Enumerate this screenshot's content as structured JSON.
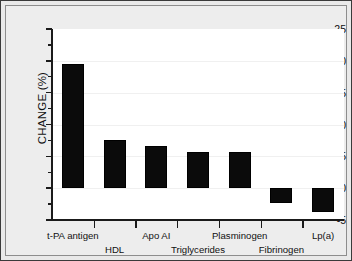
{
  "chart_data": {
    "type": "bar",
    "title": "",
    "subtitle": "",
    "xlabel": "",
    "ylabel": "CHANGE (%)",
    "categories": [
      "t-PA antigen",
      "HDL",
      "Apo AI",
      "Triglycerides",
      "Plasminogen",
      "Fibrinogen",
      "Lp(a)"
    ],
    "values": [
      19.5,
      7.5,
      6.7,
      5.7,
      5.7,
      -2.3,
      -3.8
    ],
    "series": [
      {
        "name": "Change",
        "values": [
          19.5,
          7.5,
          6.7,
          5.7,
          5.7,
          -2.3,
          -3.8
        ]
      }
    ],
    "ylim": [
      -5,
      25
    ],
    "ytick_labels": [
      "25",
      "20",
      "15",
      "10",
      "5",
      "0",
      "-5"
    ],
    "ytick_values": [
      25,
      20,
      15,
      10,
      5,
      0,
      -5
    ],
    "yminor_step": 2.5,
    "grid": "horizontal-faint",
    "legend": "none",
    "bar_color": "#0b0b0b",
    "plot_background": "#ffffff",
    "figure_background": "#ededed",
    "border_color": "#3a3a3a",
    "label_rows": [
      0,
      1,
      0,
      1,
      0,
      1,
      0
    ],
    "annotations": []
  }
}
